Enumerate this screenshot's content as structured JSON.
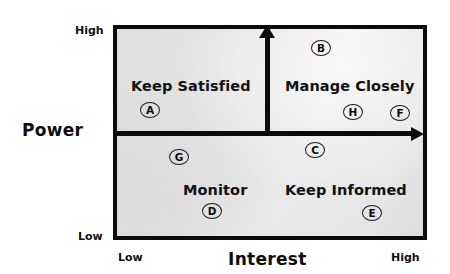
{
  "axes": {
    "y": {
      "title": "Power",
      "high_label": "High",
      "low_label": "Low"
    },
    "x": {
      "title": "Interest",
      "high_label": "High",
      "low_label": "Low"
    }
  },
  "quadrants": [
    {
      "id": "keep-satisfied",
      "label": "Keep Satisfied",
      "power": "High",
      "interest": "Low"
    },
    {
      "id": "manage-closely",
      "label": "Manage Closely",
      "power": "High",
      "interest": "High"
    },
    {
      "id": "monitor",
      "label": "Monitor",
      "power": "Low",
      "interest": "Low"
    },
    {
      "id": "keep-informed",
      "label": "Keep Informed",
      "power": "Low",
      "interest": "High"
    }
  ],
  "markers": [
    {
      "id": "A",
      "label": "A",
      "quadrant": "keep-satisfied",
      "x": 150,
      "y": 110
    },
    {
      "id": "B",
      "label": "B",
      "quadrant": "manage-closely",
      "x": 321,
      "y": 48
    },
    {
      "id": "C",
      "label": "C",
      "quadrant": "keep-informed",
      "x": 315,
      "y": 150
    },
    {
      "id": "D",
      "label": "D",
      "quadrant": "monitor",
      "x": 212,
      "y": 211
    },
    {
      "id": "E",
      "label": "E",
      "quadrant": "keep-informed",
      "x": 372,
      "y": 213
    },
    {
      "id": "F",
      "label": "F",
      "quadrant": "manage-closely",
      "x": 400,
      "y": 113
    },
    {
      "id": "G",
      "label": "G",
      "quadrant": "monitor",
      "x": 179,
      "y": 157
    },
    {
      "id": "H",
      "label": "H",
      "quadrant": "manage-closely",
      "x": 353,
      "y": 112
    }
  ],
  "chart_data": {
    "type": "scatter",
    "title": "",
    "xlabel": "Interest",
    "ylabel": "Power",
    "xlim": [
      0,
      1
    ],
    "ylim": [
      0,
      1
    ],
    "xtick_labels": [
      "Low",
      "High"
    ],
    "ytick_labels": [
      "Low",
      "High"
    ],
    "grid": false,
    "legend": "none",
    "quadrant_annotations": [
      {
        "label": "Keep Satisfied",
        "x": 0.25,
        "y": 0.75
      },
      {
        "label": "Manage Closely",
        "x": 0.75,
        "y": 0.75
      },
      {
        "label": "Monitor",
        "x": 0.25,
        "y": 0.25
      },
      {
        "label": "Keep Informed",
        "x": 0.75,
        "y": 0.25
      }
    ],
    "points": [
      {
        "label": "A",
        "x": 0.12,
        "y": 0.6
      },
      {
        "label": "B",
        "x": 0.66,
        "y": 0.89
      },
      {
        "label": "C",
        "x": 0.64,
        "y": 0.42
      },
      {
        "label": "D",
        "x": 0.32,
        "y": 0.14
      },
      {
        "label": "E",
        "x": 0.83,
        "y": 0.13
      },
      {
        "label": "F",
        "x": 0.92,
        "y": 0.59
      },
      {
        "label": "G",
        "x": 0.21,
        "y": 0.39
      },
      {
        "label": "H",
        "x": 0.77,
        "y": 0.59
      }
    ]
  },
  "colors": {
    "plot_background": "#e6e6e6",
    "border": "#0b0b0b",
    "text": "#111111",
    "marker_stroke": "#1a1a1a"
  }
}
